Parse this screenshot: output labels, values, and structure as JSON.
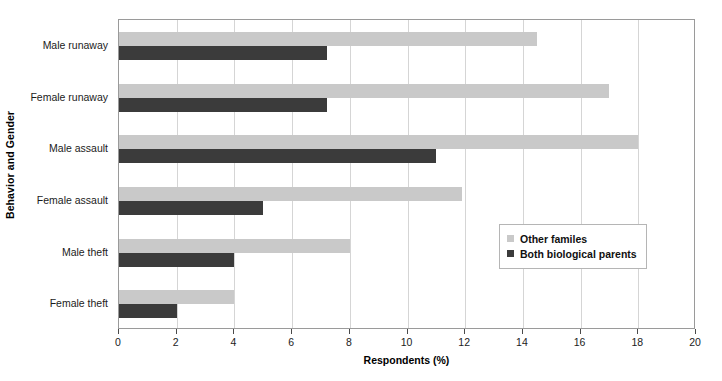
{
  "chart_data": {
    "type": "bar",
    "orientation": "horizontal",
    "title": "",
    "xlabel": "Respondents (%)",
    "ylabel": "Behavior and Gender",
    "xlim": [
      0,
      20
    ],
    "xticks": [
      0,
      2,
      4,
      6,
      8,
      10,
      12,
      14,
      16,
      18,
      20
    ],
    "grid": "vertical",
    "legend_position": "center-right-inside",
    "categories": [
      "Male runaway",
      "Female runaway",
      "Male assault",
      "Female assault",
      "Male theft",
      "Female theft"
    ],
    "series": [
      {
        "name": "Other familes",
        "color": "#c9c9c9",
        "values": [
          14.5,
          17.0,
          18.0,
          11.9,
          8.0,
          4.0
        ]
      },
      {
        "name": "Both biological parents",
        "color": "#3b3b3b",
        "values": [
          7.2,
          7.2,
          11.0,
          5.0,
          4.0,
          2.0
        ]
      }
    ]
  },
  "legend": {
    "items": [
      {
        "label": "Other familes",
        "swatch": "light"
      },
      {
        "label": "Both biological parents",
        "swatch": "dark"
      }
    ]
  }
}
